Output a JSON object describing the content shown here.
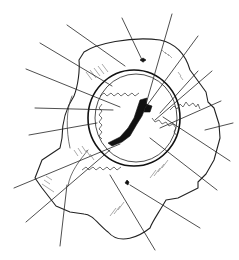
{
  "figure": {
    "type": "anatomical line illustration",
    "labels_visible": false,
    "colors": {
      "ink": "#222222",
      "background": "#ffffff"
    }
  },
  "leader_lines": [
    {
      "id": 1,
      "x1": 122,
      "y1": 18,
      "x2": 143,
      "y2": 62
    },
    {
      "id": 2,
      "x1": 172,
      "y1": 14,
      "x2": 146,
      "y2": 104
    },
    {
      "id": 3,
      "x1": 67,
      "y1": 25,
      "x2": 125,
      "y2": 66
    },
    {
      "id": 4,
      "x1": 40,
      "y1": 43,
      "x2": 112,
      "y2": 86
    },
    {
      "id": 5,
      "x1": 26,
      "y1": 69,
      "x2": 120,
      "y2": 107
    },
    {
      "id": 6,
      "x1": 198,
      "y1": 36,
      "x2": 145,
      "y2": 108
    },
    {
      "id": 7,
      "x1": 212,
      "y1": 71,
      "x2": 155,
      "y2": 120
    },
    {
      "id": 8,
      "x1": 198,
      "y1": 71,
      "x2": 160,
      "y2": 113
    },
    {
      "id": 9,
      "x1": 221,
      "y1": 101,
      "x2": 160,
      "y2": 128
    },
    {
      "id": 10,
      "x1": 233,
      "y1": 123,
      "x2": 205,
      "y2": 130
    },
    {
      "id": 11,
      "x1": 35,
      "y1": 108,
      "x2": 113,
      "y2": 110
    },
    {
      "id": 12,
      "x1": 29,
      "y1": 135,
      "x2": 97,
      "y2": 123
    },
    {
      "id": 13,
      "x1": 14,
      "y1": 188,
      "x2": 120,
      "y2": 144
    },
    {
      "id": 14,
      "x1": 26,
      "y1": 222,
      "x2": 110,
      "y2": 150
    },
    {
      "id": 15,
      "x1": 60,
      "y1": 246,
      "x2": 67,
      "y2": 185
    },
    {
      "id": 16,
      "x1": 155,
      "y1": 250,
      "x2": 110,
      "y2": 175
    },
    {
      "id": 17,
      "x1": 217,
      "y1": 190,
      "x2": 150,
      "y2": 138
    },
    {
      "id": 18,
      "x1": 230,
      "y1": 161,
      "x2": 163,
      "y2": 117
    },
    {
      "id": 19,
      "x1": 200,
      "y1": 228,
      "x2": 130,
      "y2": 185
    }
  ]
}
